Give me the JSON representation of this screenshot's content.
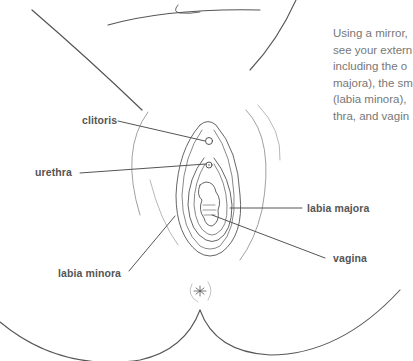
{
  "figure": {
    "labels": {
      "clitoris": "clitoris",
      "urethra": "urethra",
      "labia_majora": "labia majora",
      "vagina": "vagina",
      "labia_minora": "labia minora"
    },
    "colors": {
      "line": "#555555",
      "label_text": "#555555",
      "body_text": "#777777",
      "background": "#ffffff"
    }
  },
  "sidebar_text": {
    "lines": [
      "Using a mirror,",
      "see your extern",
      "including the o",
      "majora), the sm",
      "(labia minora),",
      "thra, and vagin"
    ]
  }
}
